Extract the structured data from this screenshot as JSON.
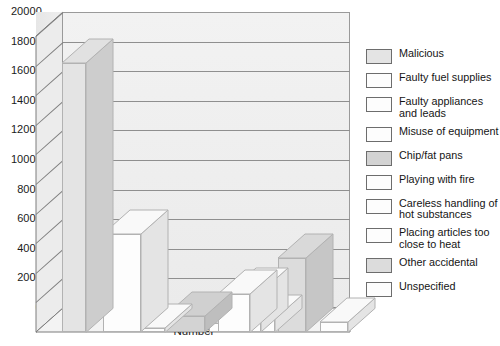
{
  "chart_data": {
    "type": "bar",
    "title": "",
    "subtitle": "",
    "xlabel": "Number",
    "ylabel": "",
    "ylim": [
      0,
      20000
    ],
    "ytick_values": [
      0,
      2000,
      4000,
      6000,
      8000,
      10000,
      12000,
      14000,
      16000,
      18000,
      20000
    ],
    "ytick_labels": [
      "0",
      "2000",
      "4000",
      "6000",
      "8000",
      "10000",
      "12000",
      "14000",
      "16000",
      "18000",
      "20000"
    ],
    "grid": true,
    "legend_position": "right",
    "style": "3d-bar",
    "categories": [
      "Malicious",
      "Faulty fuel supplies",
      "Faulty appliances and leads",
      "Misuse of equipment",
      "Chip/fat pans",
      "Playing with fire",
      "Careless handling of hot substances",
      "Placing articles too close to heat",
      "Other accidental",
      "Unspecified"
    ],
    "values": [
      18200,
      6600,
      300,
      1100,
      2600,
      600,
      2700,
      900,
      5000,
      700
    ],
    "colors": [
      "#e4e4e4",
      "#fdfdfd",
      "#fdfdfd",
      "#d3d3d3",
      "#fdfdfd",
      "#fdfdfd",
      "#fdfdfd",
      "#fdfdfd",
      "#dcdcdc",
      "#fdfdfd"
    ]
  },
  "axis": {
    "x_title": "Number"
  },
  "legend": {
    "items": [
      {
        "label": "Malicious",
        "swatch": "#e4e4e4"
      },
      {
        "label": "Faulty fuel supplies",
        "swatch": "#fdfdfd"
      },
      {
        "label": "Faulty appliances\nand leads",
        "swatch": "#fdfdfd"
      },
      {
        "label": "Misuse of equipment",
        "swatch": "#fdfdfd"
      },
      {
        "label": "Chip/fat pans",
        "swatch": "#d3d3d3"
      },
      {
        "label": "Playing with fire",
        "swatch": "#fdfdfd"
      },
      {
        "label": "Careless handling of\nhot substances",
        "swatch": "#fdfdfd"
      },
      {
        "label": "Placing articles too\nclose to heat",
        "swatch": "#fdfdfd"
      },
      {
        "label": "Other accidental",
        "swatch": "#dcdcdc"
      },
      {
        "label": "Unspecified",
        "swatch": "#fdfdfd"
      }
    ]
  },
  "theme": {
    "plot_background": "#eeeeee",
    "grid_color": "#8f8f8f",
    "axis_color": "#7d7d7d",
    "text_color": "#1a1a1a"
  }
}
